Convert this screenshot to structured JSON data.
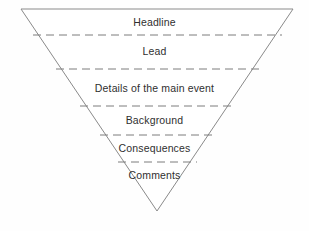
{
  "diagram": {
    "name": "inverted-pyramid-news-structure",
    "background_color": "#fefefe",
    "outline_color": "#8a8a8a",
    "divider_color": "#7d7d7d",
    "text_color": "#2f2f2f",
    "geometry": {
      "top_left_x": 21,
      "top_left_y": 9,
      "top_right_x": 293,
      "top_right_y": 9,
      "apex_x": 157,
      "apex_y": 211
    },
    "tiers": [
      {
        "id": "headline",
        "label": "Headline",
        "text_y": 16,
        "divider_y": 35,
        "divider_x1": 33,
        "divider_x2": 282
      },
      {
        "id": "lead",
        "label": "Lead",
        "text_y": 45,
        "divider_y": 69,
        "divider_x1": 56,
        "divider_x2": 259
      },
      {
        "id": "details",
        "label": "Details of the main event",
        "text_y": 82,
        "divider_y": 106,
        "divider_x1": 80,
        "divider_x2": 233
      },
      {
        "id": "background",
        "label": "Background",
        "text_y": 114,
        "divider_y": 135,
        "divider_x1": 100,
        "divider_x2": 213
      },
      {
        "id": "consequences",
        "label": "Consequences",
        "text_y": 142,
        "divider_y": 162,
        "divider_x1": 118,
        "divider_x2": 197
      },
      {
        "id": "comments",
        "label": "Comments",
        "text_y": 169,
        "divider_y": null,
        "divider_x1": null,
        "divider_x2": null
      }
    ]
  }
}
